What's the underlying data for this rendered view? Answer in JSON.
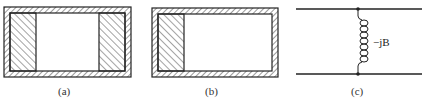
{
  "figures": [
    {
      "id": "a",
      "caption": "(a)",
      "description": "Waveguide cross-section with dielectric slabs at both side walls"
    },
    {
      "id": "b",
      "caption": "(b)",
      "description": "Waveguide cross-section with dielectric slab at left wall"
    },
    {
      "id": "c",
      "caption": "(c)",
      "description": "Equivalent circuit: shunt inductive susceptance across transmission line",
      "element_label": "−jB"
    }
  ],
  "colors": {
    "stroke": "#222222",
    "hatch": "#333333",
    "background": "#ffffff"
  }
}
